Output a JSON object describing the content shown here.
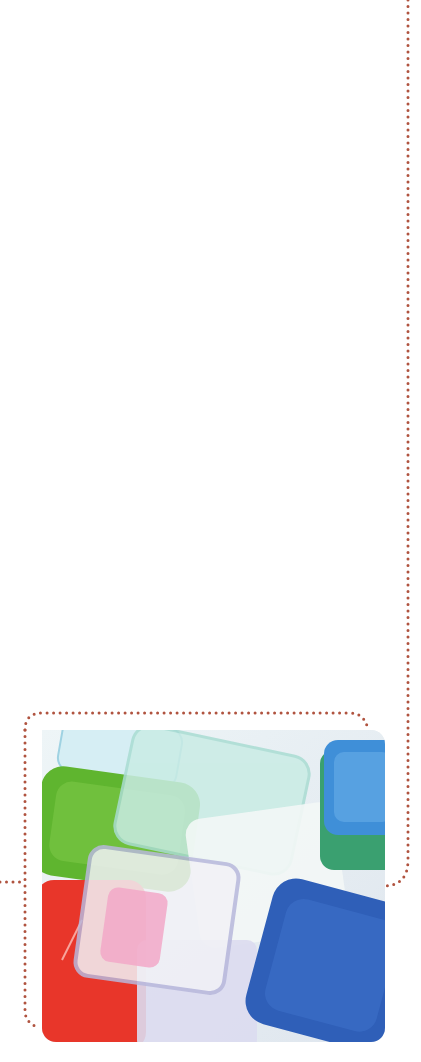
{
  "page": {
    "background": "#ffffff",
    "frame_line_color": "#b0533f"
  },
  "photo": {
    "subject": "stacked colorful plastic food storage containers",
    "container_colors": [
      "#5fb52f",
      "#e8362a",
      "#2f5fb8",
      "#3f8fd8",
      "#3aa070",
      "#bfe6e0",
      "#f2a8c8"
    ]
  }
}
